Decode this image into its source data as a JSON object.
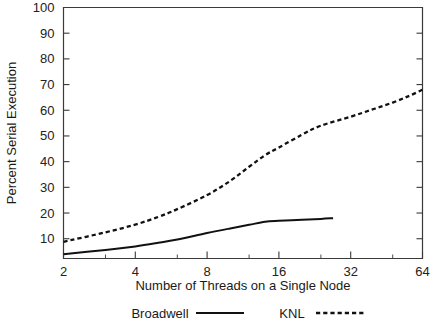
{
  "chart_data": {
    "type": "line",
    "title": "",
    "xlabel": "Number of Threads on a Single Node",
    "ylabel": "Percent Serial Execution",
    "xscale": "log2",
    "xlim": [
      2,
      64
    ],
    "ylim": [
      2.3,
      100
    ],
    "grid": false,
    "legend_position": "bottom",
    "xticks": [
      2,
      4,
      8,
      16,
      32,
      64
    ],
    "xticklabels": [
      "2",
      "4",
      "8",
      "16",
      "32",
      "64"
    ],
    "yticks": [
      10,
      20,
      30,
      40,
      50,
      60,
      70,
      80,
      90,
      100
    ],
    "yticklabels": [
      "10",
      "20",
      "30",
      "40",
      "50",
      "60",
      "70",
      "80",
      "90",
      "100"
    ],
    "x": [
      2,
      3,
      4,
      5,
      6,
      8,
      10,
      12,
      14,
      16,
      20,
      24,
      27,
      32,
      40,
      48,
      56,
      64
    ],
    "series": [
      {
        "name": "Broadwell",
        "style": "solid",
        "color": "#111111",
        "x": [
          2,
          3,
          4,
          5,
          6,
          8,
          10,
          12,
          14,
          16,
          20,
          24,
          27
        ],
        "values": [
          4.0,
          5.6,
          7.0,
          8.4,
          9.7,
          12.2,
          14.0,
          15.4,
          16.6,
          17.0,
          17.4,
          17.7,
          18.0
        ]
      },
      {
        "name": "KNL",
        "style": "dashed",
        "color": "#111111",
        "x": [
          2,
          3,
          4,
          5,
          6,
          8,
          10,
          12,
          14,
          16,
          20,
          24,
          32,
          40,
          48,
          56,
          64
        ],
        "values": [
          8.8,
          12.5,
          15.5,
          18.5,
          21.5,
          27.0,
          32.5,
          38.0,
          42.5,
          45.5,
          50.5,
          54.0,
          57.5,
          60.5,
          63.0,
          65.5,
          68.0
        ]
      }
    ],
    "legend": [
      {
        "label": "Broadwell",
        "style": "solid"
      },
      {
        "label": "KNL",
        "style": "dashed"
      }
    ]
  }
}
